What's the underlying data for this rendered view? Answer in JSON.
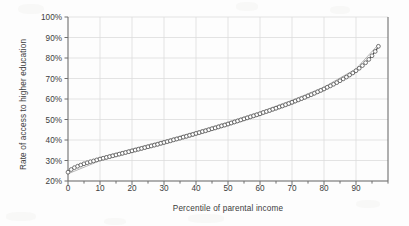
{
  "chart_data": {
    "type": "line",
    "title": "",
    "xlabel": "Percentile of parental income",
    "ylabel": "Rate of access to higher education",
    "xlim": [
      0,
      100
    ],
    "ylim": [
      20,
      100
    ],
    "grid": true,
    "legend": null,
    "marker": "open-circle",
    "x_ticks": [
      0,
      10,
      20,
      30,
      40,
      50,
      60,
      70,
      80,
      90
    ],
    "x_tick_labels": [
      "0",
      "10",
      "20",
      "30",
      "40",
      "50",
      "60",
      "70",
      "80",
      "90"
    ],
    "x_minor_tick_step": 5,
    "y_ticks": [
      20,
      30,
      40,
      50,
      60,
      70,
      80,
      90,
      100
    ],
    "y_tick_labels": [
      "20%",
      "30%",
      "40%",
      "50%",
      "60%",
      "70%",
      "80%",
      "90%",
      "100%"
    ],
    "series": [
      {
        "name": "Rate of access to higher education",
        "x": [
          0,
          1,
          2,
          3,
          4,
          5,
          6,
          7,
          8,
          9,
          10,
          11,
          12,
          13,
          14,
          15,
          16,
          17,
          18,
          19,
          20,
          21,
          22,
          23,
          24,
          25,
          26,
          27,
          28,
          29,
          30,
          31,
          32,
          33,
          34,
          35,
          36,
          37,
          38,
          39,
          40,
          41,
          42,
          43,
          44,
          45,
          46,
          47,
          48,
          49,
          50,
          51,
          52,
          53,
          54,
          55,
          56,
          57,
          58,
          59,
          60,
          61,
          62,
          63,
          64,
          65,
          66,
          67,
          68,
          69,
          70,
          71,
          72,
          73,
          74,
          75,
          76,
          77,
          78,
          79,
          80,
          81,
          82,
          83,
          84,
          85,
          86,
          87,
          88,
          89,
          90,
          91,
          92,
          93,
          94,
          95,
          96,
          97
        ],
        "values": [
          24.3,
          25.6,
          26.5,
          27.2,
          27.8,
          28.4,
          28.9,
          29.4,
          29.8,
          30.3,
          30.7,
          31.1,
          31.5,
          31.9,
          32.3,
          32.7,
          33.1,
          33.5,
          33.9,
          34.3,
          34.7,
          35.1,
          35.5,
          35.9,
          36.3,
          36.7,
          37.1,
          37.5,
          37.9,
          38.4,
          38.8,
          39.2,
          39.6,
          40.1,
          40.5,
          40.9,
          41.4,
          41.8,
          42.3,
          42.7,
          43.2,
          43.6,
          44.1,
          44.5,
          45.0,
          45.5,
          45.9,
          46.4,
          46.9,
          47.3,
          47.8,
          48.3,
          48.8,
          49.3,
          49.8,
          50.3,
          50.8,
          51.3,
          51.8,
          52.3,
          52.8,
          53.4,
          53.9,
          54.4,
          55.0,
          55.5,
          56.1,
          56.6,
          57.2,
          57.8,
          58.4,
          59.0,
          59.6,
          60.2,
          60.8,
          61.5,
          62.1,
          62.8,
          63.5,
          64.2,
          64.9,
          65.7,
          66.4,
          67.2,
          68.0,
          68.9,
          69.8,
          70.7,
          71.7,
          72.7,
          73.8,
          75.0,
          76.3,
          77.7,
          79.3,
          81.1,
          83.2,
          85.7
        ]
      },
      {
        "name": "Rate of access to higher education (upper band)",
        "x": [
          0,
          10,
          20,
          30,
          40,
          50,
          60,
          70,
          80,
          90,
          97
        ],
        "values": [
          25.2,
          31.5,
          35.6,
          39.7,
          44.1,
          48.7,
          53.7,
          59.4,
          65.8,
          74.7,
          86.6
        ]
      },
      {
        "name": "Rate of access to higher education (lower band)",
        "x": [
          0,
          10,
          20,
          30,
          40,
          50,
          60,
          70,
          80,
          90,
          97
        ],
        "values": [
          23.5,
          29.9,
          33.9,
          37.9,
          42.3,
          46.9,
          51.9,
          57.4,
          64.0,
          72.9,
          84.8
        ]
      }
    ]
  },
  "colors": {
    "grid": "#dcdcdc",
    "axis": "#6f6f6f",
    "marker_stroke": "#4a4a4a",
    "line": "#2f2f2f",
    "text": "#3c3c3c",
    "background": "#fdfdfd"
  }
}
